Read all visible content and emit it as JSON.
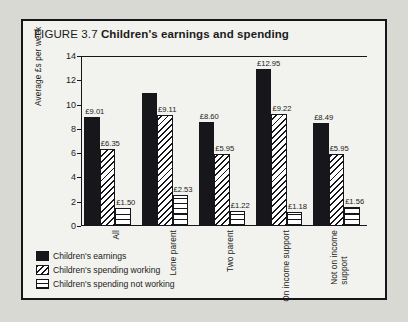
{
  "figure": {
    "number": "FIGURE 3.7",
    "name": "Children's earnings and spending"
  },
  "chart_data": {
    "type": "bar",
    "title": "Children's earnings and spending",
    "xlabel": "",
    "ylabel": "Average £s per week",
    "ylim": [
      0,
      14
    ],
    "yticks": [
      "0",
      "2",
      "4",
      "6",
      "8",
      "10",
      "12",
      "14"
    ],
    "grid": false,
    "legend_position": "bottom-left",
    "categories": [
      "All",
      "Lone parent",
      "Two parent",
      "On income support",
      "Not on income support"
    ],
    "series": [
      {
        "name": "Children's earnings",
        "values": [
          9.01,
          10.95,
          8.6,
          12.95,
          8.49
        ],
        "labels": [
          "£9.01",
          "",
          "£8.60",
          "£12.95",
          "£8.49"
        ]
      },
      {
        "name": "Children's spending working",
        "values": [
          6.35,
          9.11,
          5.95,
          9.22,
          5.95
        ],
        "labels": [
          "£6.35",
          "£9.11",
          "£5.95",
          "£9.22",
          "£5.95"
        ]
      },
      {
        "name": "Children's spending not working",
        "values": [
          1.5,
          2.53,
          1.22,
          1.18,
          1.56
        ],
        "labels": [
          "£1.50",
          "£2.53",
          "£1.22",
          "£1.18",
          "£1.56"
        ]
      }
    ]
  },
  "legend": [
    {
      "key": "earn",
      "label": "Children's earnings"
    },
    {
      "key": "spwork",
      "label": "Children's spending working"
    },
    {
      "key": "spnot",
      "label": "Children's spending not working"
    }
  ]
}
